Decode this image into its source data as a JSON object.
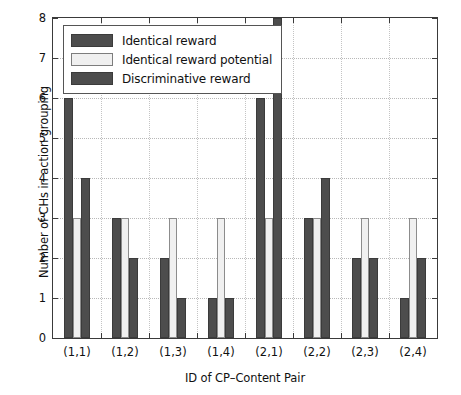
{
  "chart_data": {
    "type": "bar",
    "title": "",
    "xlabel": "ID of CP–Content Pair",
    "ylabel": "Number of CHs in action grouping",
    "categories": [
      "(1,1)",
      "(1,2)",
      "(1,3)",
      "(1,4)",
      "(2,1)",
      "(2,2)",
      "(2,3)",
      "(2,4)"
    ],
    "series": [
      {
        "name": "Identical reward",
        "color": "#4d4d4d",
        "values": [
          6,
          3,
          2,
          1,
          6,
          3,
          2,
          1
        ]
      },
      {
        "name": "Identical reward potential",
        "color": "#f0f0f0",
        "values": [
          3,
          3,
          3,
          3,
          3,
          3,
          3,
          3
        ]
      },
      {
        "name": "Discriminative reward",
        "color": "#4d4d4d",
        "values": [
          4,
          2,
          1,
          1,
          8,
          4,
          2,
          2
        ]
      }
    ],
    "ylim": [
      0,
      8
    ],
    "yticks": [
      0,
      1,
      2,
      3,
      4,
      5,
      6,
      7,
      8
    ],
    "ytick_labels": [
      "0",
      "1",
      "2",
      "3",
      "4",
      "5",
      "6",
      "7",
      "8"
    ],
    "grid": true,
    "grid_style": "dotted",
    "grid_color": "#b8b8b8",
    "legend_position": "upper-left",
    "axis_color": "#3a3a3a",
    "background": "#ffffff"
  }
}
